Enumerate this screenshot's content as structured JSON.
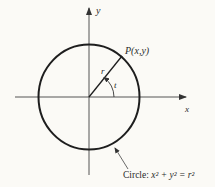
{
  "diagram": {
    "axes": {
      "x_label": "x",
      "y_label": "y"
    },
    "point_label": "P(x,y)",
    "radius_label": "r",
    "angle_label": "t",
    "caption": {
      "prefix": "Circle: ",
      "equation": "x² + y² = r²"
    },
    "colors": {
      "background": "#fbfaf6",
      "ink": "#1e1e1e",
      "axis": "#555555"
    }
  }
}
